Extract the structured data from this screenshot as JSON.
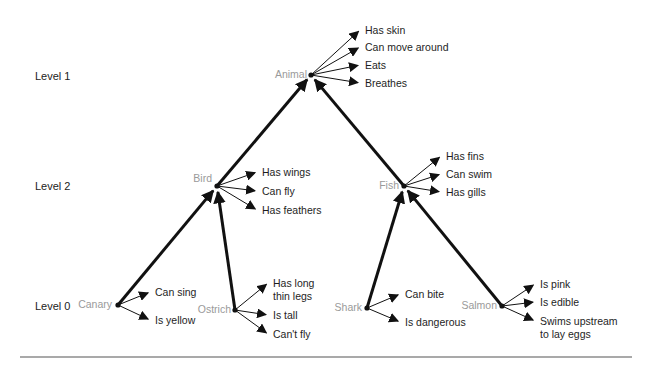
{
  "levels": [
    {
      "label": "Level 1",
      "x": 35,
      "y": 80
    },
    {
      "label": "Level 2",
      "x": 35,
      "y": 190
    },
    {
      "label": "Level 0",
      "x": 35,
      "y": 310
    }
  ],
  "nodes": [
    {
      "id": "animal",
      "label": "Animal",
      "x": 311,
      "y": 75,
      "labelAnchor": "end",
      "labelDx": -4,
      "labelDy": 3,
      "properties": [
        {
          "text": [
            "Has skin"
          ],
          "x": 365,
          "y": 34
        },
        {
          "text": [
            "Can move around"
          ],
          "x": 365,
          "y": 51
        },
        {
          "text": [
            "Eats"
          ],
          "x": 365,
          "y": 69
        },
        {
          "text": [
            "Breathes"
          ],
          "x": 365,
          "y": 87
        }
      ]
    },
    {
      "id": "bird",
      "label": "Bird",
      "x": 217,
      "y": 186,
      "labelAnchor": "end",
      "labelDx": -5,
      "labelDy": -4,
      "properties": [
        {
          "text": [
            "Has wings"
          ],
          "x": 262,
          "y": 176
        },
        {
          "text": [
            "Can fly"
          ],
          "x": 262,
          "y": 195
        },
        {
          "text": [
            "Has feathers"
          ],
          "x": 262,
          "y": 214
        }
      ]
    },
    {
      "id": "fish",
      "label": "Fish",
      "x": 404,
      "y": 186,
      "labelAnchor": "end",
      "labelDx": -5,
      "labelDy": 3,
      "properties": [
        {
          "text": [
            "Has fins"
          ],
          "x": 446,
          "y": 160
        },
        {
          "text": [
            "Can swim"
          ],
          "x": 446,
          "y": 178
        },
        {
          "text": [
            "Has gills"
          ],
          "x": 446,
          "y": 196
        }
      ]
    },
    {
      "id": "canary",
      "label": "Canary",
      "x": 118,
      "y": 305,
      "labelAnchor": "end",
      "labelDx": -6,
      "labelDy": 3,
      "properties": [
        {
          "text": [
            "Can sing"
          ],
          "x": 155,
          "y": 296
        },
        {
          "text": [
            "Is yellow"
          ],
          "x": 155,
          "y": 324
        }
      ]
    },
    {
      "id": "ostrich",
      "label": "Ostrich",
      "x": 235,
      "y": 310,
      "labelAnchor": "end",
      "labelDx": -4,
      "labelDy": 3,
      "properties": [
        {
          "text": [
            "Has long",
            "thin legs"
          ],
          "x": 273,
          "y": 287
        },
        {
          "text": [
            "Is tall"
          ],
          "x": 273,
          "y": 319
        },
        {
          "text": [
            "Can't fly"
          ],
          "x": 273,
          "y": 338
        }
      ]
    },
    {
      "id": "shark",
      "label": "Shark",
      "x": 367,
      "y": 308,
      "labelAnchor": "end",
      "labelDx": -5,
      "labelDy": 3,
      "properties": [
        {
          "text": [
            "Can bite"
          ],
          "x": 405,
          "y": 298
        },
        {
          "text": [
            "Is dangerous"
          ],
          "x": 405,
          "y": 326
        }
      ]
    },
    {
      "id": "salmon",
      "label": "Salmon",
      "x": 502,
      "y": 306,
      "labelAnchor": "end",
      "labelDx": -5,
      "labelDy": 3,
      "properties": [
        {
          "text": [
            "Is pink"
          ],
          "x": 540,
          "y": 288
        },
        {
          "text": [
            "Is edible"
          ],
          "x": 540,
          "y": 306
        },
        {
          "text": [
            "Swims upstream",
            "to lay eggs"
          ],
          "x": 540,
          "y": 325
        }
      ]
    }
  ],
  "isa_links": [
    {
      "from": "bird",
      "to": "animal"
    },
    {
      "from": "fish",
      "to": "animal"
    },
    {
      "from": "canary",
      "to": "bird"
    },
    {
      "from": "ostrich",
      "to": "bird"
    },
    {
      "from": "shark",
      "to": "fish"
    },
    {
      "from": "salmon",
      "to": "fish"
    }
  ],
  "colors": {
    "node_label": "#9a9a9a",
    "property_label": "#1e1e1e",
    "lines": "#111111",
    "rule": "#555555"
  },
  "rule": {
    "x1": 20,
    "x2": 632,
    "y": 357
  }
}
